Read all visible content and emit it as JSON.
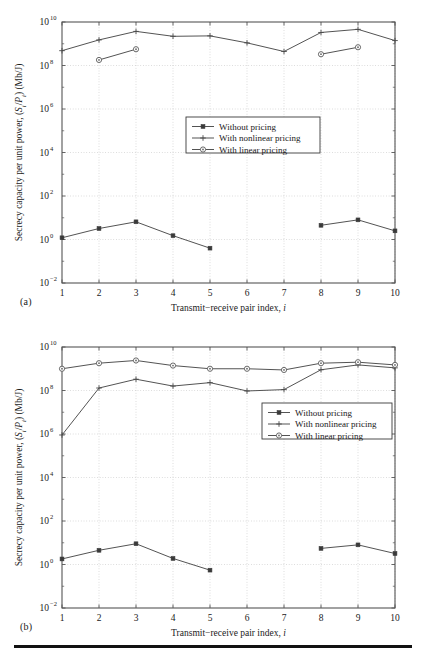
{
  "figure": {
    "panels": [
      {
        "tag": "(a)",
        "id": "panel-a"
      },
      {
        "tag": "(b)",
        "id": "panel-b"
      }
    ]
  },
  "axes": {
    "xlabel_main": "Transmit−receive pair index, ",
    "xlabel_italic": "i",
    "ylabel_part1": "Secrecy capacity per unit power, (",
    "ylabel_italic1": "S",
    "ylabel_sub1": "i",
    "ylabel_slash": "/",
    "ylabel_italic2": "P",
    "ylabel_sub2": "i",
    "ylabel_part2": ") (Mb/J)",
    "xticks": [
      "1",
      "2",
      "3",
      "4",
      "5",
      "6",
      "7",
      "8",
      "9",
      "10"
    ],
    "yticks": [
      "10",
      "10",
      "10",
      "10",
      "10",
      "10",
      "10"
    ],
    "yexps": [
      "10",
      "8",
      "6",
      "4",
      "2",
      "0",
      "−2"
    ]
  },
  "legend": {
    "items": [
      {
        "label": "Without pricing",
        "marker": "square",
        "color": "#404040"
      },
      {
        "label": "With nonlinear pricing",
        "marker": "plus",
        "color": "#404040"
      },
      {
        "label": "With linear pricing",
        "marker": "circle",
        "color": "#606060"
      }
    ]
  },
  "chart_data": [
    {
      "type": "line",
      "panel": "(a)",
      "title": "",
      "xlabel": "Transmit−receive pair index, i",
      "ylabel": "Secrecy capacity per unit power, (S_i/P_i) (Mb/J)",
      "yscale": "log",
      "ylim": [
        0.01,
        10000000000
      ],
      "xlim": [
        1,
        10
      ],
      "grid": true,
      "legend_position": "center",
      "x": [
        1,
        2,
        3,
        4,
        5,
        6,
        7,
        8,
        9,
        10
      ],
      "series": [
        {
          "name": "Without pricing",
          "marker": "square",
          "x": [
            1,
            2,
            3,
            4,
            5,
            8,
            9,
            10
          ],
          "values": [
            1.2,
            3.2,
            6.5,
            1.5,
            0.4,
            4.5,
            8.0,
            2.5
          ]
        },
        {
          "name": "With nonlinear pricing",
          "marker": "plus",
          "x": [
            1,
            2,
            3,
            4,
            5,
            6,
            7,
            8,
            9,
            10
          ],
          "values": [
            480000000,
            1500000000,
            3700000000,
            2200000000,
            2300000000,
            1100000000,
            440000000,
            3300000000,
            4600000000,
            1400000000
          ]
        },
        {
          "name": "With linear pricing",
          "marker": "circle",
          "x": [
            2,
            3,
            8,
            9
          ],
          "values": [
            180000000,
            560000000,
            330000000,
            690000000
          ]
        }
      ]
    },
    {
      "type": "line",
      "panel": "(b)",
      "title": "",
      "xlabel": "Transmit−receive pair index, i",
      "ylabel": "Secrecy capacity per unit power, (S_i/P_i) (Mb/J)",
      "yscale": "log",
      "ylim": [
        0.01,
        10000000000
      ],
      "xlim": [
        1,
        10
      ],
      "grid": true,
      "legend_position": "center-right",
      "x": [
        1,
        2,
        3,
        4,
        5,
        6,
        7,
        8,
        9,
        10
      ],
      "series": [
        {
          "name": "Without pricing",
          "marker": "square",
          "x": [
            1,
            2,
            3,
            4,
            5,
            8,
            9,
            10
          ],
          "values": [
            1.8,
            4.5,
            9.0,
            1.9,
            0.55,
            5.5,
            8.0,
            3.2
          ]
        },
        {
          "name": "With nonlinear pricing",
          "marker": "plus",
          "x": [
            1,
            2,
            3,
            4,
            5,
            6,
            7,
            8,
            9,
            10
          ],
          "values": [
            900000,
            130000000,
            330000000,
            160000000,
            230000000,
            95000000,
            110000000,
            900000000,
            1500000000,
            1100000000
          ]
        },
        {
          "name": "With linear pricing",
          "marker": "circle",
          "x": [
            1,
            2,
            3,
            4,
            5,
            6,
            7,
            8,
            9,
            10
          ],
          "values": [
            1000000000,
            1800000000,
            2400000000,
            1400000000,
            1000000000,
            1000000000,
            880000000,
            1800000000,
            2000000000,
            1500000000
          ]
        }
      ]
    }
  ]
}
